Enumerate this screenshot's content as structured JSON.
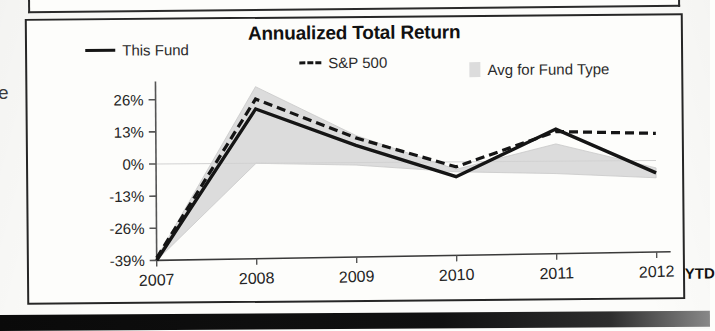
{
  "panel": {
    "title": "Annualized Total Return",
    "left_margin_glyph": "e"
  },
  "legend": {
    "items": [
      {
        "label": "This Fund",
        "marker": "solid-line-swatch",
        "color": "#151515"
      },
      {
        "label": "S&P 500",
        "marker": "dashed-line-swatch",
        "color": "#151515"
      },
      {
        "label": "Avg for Fund Type",
        "marker": "area-swatch",
        "color": "#dcdcdc"
      }
    ]
  },
  "axis": {
    "y_ticks": [
      "26%",
      "13%",
      "0%",
      "-13%",
      "-26%",
      "-39%"
    ],
    "x_ticks": [
      "2007",
      "2008",
      "2009",
      "2010",
      "2011",
      "2012"
    ],
    "x_suffix": "YTD"
  },
  "chart_data": {
    "type": "line",
    "title": "Annualized Total Return",
    "xlabel": "",
    "ylabel": "",
    "x": [
      "2007",
      "2008",
      "2009",
      "2010",
      "2011",
      "2012"
    ],
    "categories": [
      "2007",
      "2008",
      "2009",
      "2010",
      "2011",
      "2012"
    ],
    "ylim": [
      -39,
      31
    ],
    "ytick_values": [
      26,
      13,
      0,
      -13,
      -26,
      -39
    ],
    "ytick_labels": [
      "26%",
      "13%",
      "0%",
      "-13%",
      "-26%",
      "-39%"
    ],
    "grid": false,
    "legend_position": "top",
    "series": [
      {
        "name": "This Fund",
        "style": "solid",
        "color": "#151515",
        "values": [
          -39,
          22,
          7,
          -6,
          13,
          -5
        ]
      },
      {
        "name": "S&P 500",
        "style": "dashed",
        "color": "#151515",
        "values": [
          -38,
          26,
          10,
          -2,
          12,
          11
        ]
      },
      {
        "name": "Avg for Fund Type",
        "style": "area-band",
        "color": "#dcdcdc",
        "upper_values": [
          -38,
          31,
          11,
          -3,
          7,
          -3
        ],
        "lower_values": [
          -39,
          0,
          -1,
          -4,
          -5,
          -7
        ]
      }
    ]
  }
}
